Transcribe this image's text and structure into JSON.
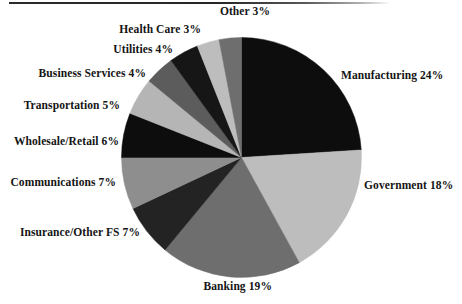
{
  "figure": {
    "background_color": "#ffffff",
    "rule_color": "#2b2b2b"
  },
  "chart_data": {
    "type": "pie",
    "title": "",
    "subtitle": "",
    "xlabel": "",
    "ylabel": "",
    "legend_position": "none",
    "grid": false,
    "start_angle_deg": 0,
    "direction": "clockwise",
    "units": "percent",
    "categories": [
      "Manufacturing",
      "Government",
      "Banking",
      "Insurance/Other FS",
      "Communications",
      "Wholesale/Retail",
      "Transportation",
      "Business Services",
      "Utilities",
      "Health Care",
      "Other"
    ],
    "values": [
      24,
      18,
      19,
      7,
      7,
      6,
      5,
      4,
      4,
      3,
      3
    ],
    "colors": [
      "#0d0d0d",
      "#bdbdbd",
      "#6e6e6e",
      "#232323",
      "#8e8e8e",
      "#0d0d0d",
      "#b5b5b5",
      "#5c5c5c",
      "#161616",
      "#bdbdbd",
      "#6e6e6e"
    ],
    "slices": [
      {
        "label": "Manufacturing 24%",
        "name": "Manufacturing",
        "value": 24,
        "color": "#0d0d0d"
      },
      {
        "label": "Government 18%",
        "name": "Government",
        "value": 18,
        "color": "#bdbdbd"
      },
      {
        "label": "Banking 19%",
        "name": "Banking",
        "value": 19,
        "color": "#6e6e6e"
      },
      {
        "label": "Insurance/Other FS 7%",
        "name": "Insurance/Other FS",
        "value": 7,
        "color": "#232323"
      },
      {
        "label": "Communications 7%",
        "name": "Communications",
        "value": 7,
        "color": "#8e8e8e"
      },
      {
        "label": "Wholesale/Retail 6%",
        "name": "Wholesale/Retail",
        "value": 6,
        "color": "#0d0d0d"
      },
      {
        "label": "Transportation 5%",
        "name": "Transportation",
        "value": 5,
        "color": "#b5b5b5"
      },
      {
        "label": "Business Services 4%",
        "name": "Business Services",
        "value": 4,
        "color": "#5c5c5c"
      },
      {
        "label": "Utilities 4%",
        "name": "Utilities",
        "value": 4,
        "color": "#161616"
      },
      {
        "label": "Health Care 3%",
        "name": "Health Care",
        "value": 3,
        "color": "#bdbdbd"
      },
      {
        "label": "Other 3%",
        "name": "Other",
        "value": 3,
        "color": "#6e6e6e"
      }
    ]
  },
  "labels": {
    "manufacturing": "Manufacturing 24%",
    "government": "Government 18%",
    "banking": "Banking 19%",
    "insurance": "Insurance/Other FS 7%",
    "communications": "Communications 7%",
    "wholesale_retail": "Wholesale/Retail 6%",
    "transportation": "Transportation 5%",
    "business_services": "Business Services 4%",
    "utilities": "Utilities 4%",
    "health_care": "Health Care 3%",
    "other": "Other 3%"
  }
}
